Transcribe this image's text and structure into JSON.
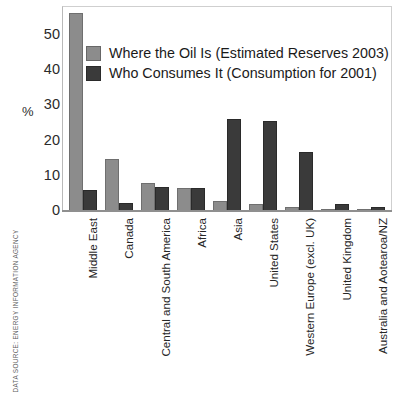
{
  "source_credit": "DATA SOURCE: ENERGY INFORMATION AGENCY",
  "colors": {
    "reserves": "#8c8c8c",
    "consumption": "#3a3a3a",
    "axis": "#b9b9b9",
    "text": "#1a1a1a"
  },
  "legend": {
    "position": "inside-top-left",
    "items": [
      {
        "label": "Where the Oil Is (Estimated Reserves 2003)",
        "swatch": "reserves"
      },
      {
        "label": "Who Consumes It (Consumption for 2001)",
        "swatch": "consumption"
      }
    ]
  },
  "axis": {
    "ylabel": "%",
    "yticks": [
      "0",
      "10",
      "20",
      "30",
      "40",
      "50"
    ]
  },
  "chart_data": {
    "type": "bar",
    "title": "",
    "xlabel": "",
    "ylabel": "%",
    "ylim": [
      0,
      58.5
    ],
    "grid": false,
    "legend_position": "inside-top-left",
    "categories": [
      "Middle East",
      "Canada",
      "Central and South America",
      "Africa",
      "Asia",
      "United States",
      "Western Europe (excl. UK)",
      "United Kingdom",
      "Australia and Aotearoa/NZ"
    ],
    "series": [
      {
        "name": "Where the Oil Is (Estimated Reserves 2003)",
        "color": "#8c8c8c",
        "values": [
          56.8,
          14.8,
          8.0,
          6.6,
          2.8,
          1.9,
          1.2,
          0.5,
          0.3
        ]
      },
      {
        "name": "Who Consumes It (Consumption for 2001)",
        "color": "#3a3a3a",
        "values": [
          6.1,
          2.4,
          6.8,
          6.6,
          26.4,
          25.7,
          17.0,
          2.1,
          1.2
        ]
      }
    ]
  }
}
